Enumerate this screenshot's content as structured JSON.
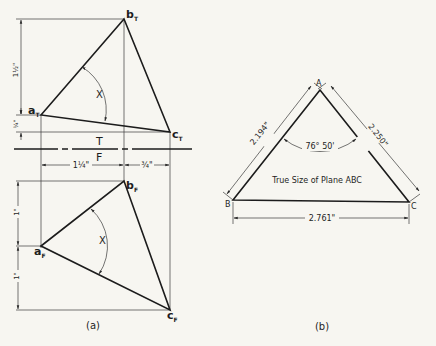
{
  "view_a": {
    "caption": "(a)",
    "fold_line": {
      "top_label": "T",
      "bottom_label": "F"
    },
    "top_view": {
      "points": {
        "a": "a",
        "a_sub": "T",
        "b": "b",
        "b_sub": "T",
        "c": "c",
        "c_sub": "T"
      },
      "angle_label": "X",
      "dim_vertical_upper": "1½\"",
      "dim_vertical_lower": "¼\""
    },
    "horizontal_dims": {
      "left": "1¼\"",
      "right": "¾\""
    },
    "front_view": {
      "points": {
        "a": "a",
        "a_sub": "F",
        "b": "b",
        "b_sub": "F",
        "c": "c",
        "c_sub": "F"
      },
      "angle_label": "X",
      "dim_vertical_upper": "1\"",
      "dim_vertical_lower": "1\""
    }
  },
  "view_b": {
    "caption": "(b)",
    "vertices": {
      "A": "A",
      "B": "B",
      "C": "C"
    },
    "edge_AB": "2.194\"",
    "edge_AC": "2.250\"",
    "edge_BC": "2.761\"",
    "angle_A": "76° 50'",
    "title": "True Size of Plane ABC"
  }
}
